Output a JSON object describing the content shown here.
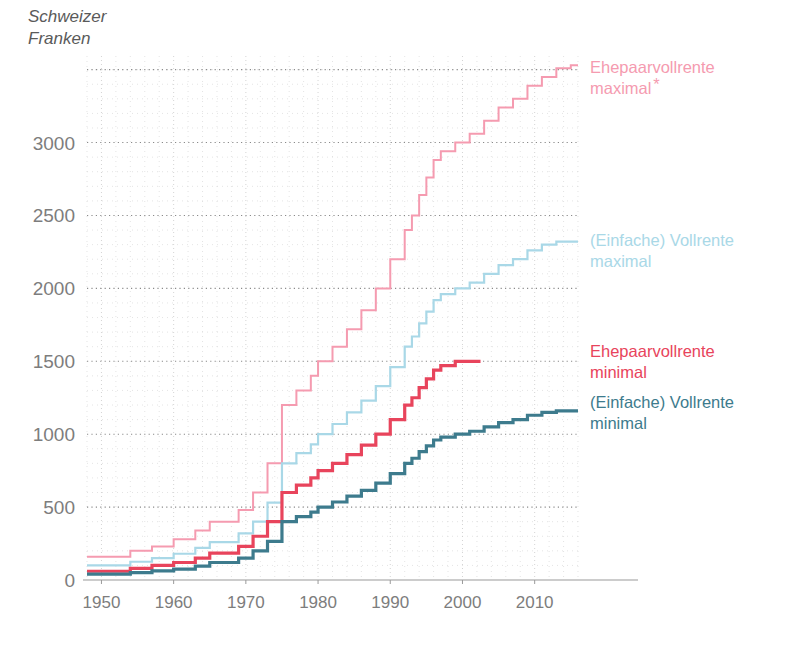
{
  "chart_data": {
    "type": "line",
    "title": "",
    "subtitle": "",
    "ylabel_line1": "Schweizer",
    "ylabel_line2": "Franken",
    "xlabel": "",
    "step_style": "post",
    "grid": true,
    "legend_position": "right-inline",
    "xlim": [
      1948,
      2016
    ],
    "ylim": [
      0,
      3580
    ],
    "yticks": [
      0,
      500,
      1000,
      1500,
      2000,
      2500,
      3000
    ],
    "ytick_labels": [
      "0",
      "500",
      "1000",
      "1500",
      "2000",
      "2500",
      "3000"
    ],
    "xticks": [
      1950,
      1960,
      1970,
      1980,
      1990,
      2000,
      2010
    ],
    "xtick_labels": [
      "1950",
      "1960",
      "1970",
      "1980",
      "1990",
      "2000",
      "2010"
    ],
    "minor_y_interval": 100,
    "minor_x_interval": 2,
    "series": [
      {
        "name": "Ehepaarvollrente maximal",
        "label_line1": "Ehepaarvollrente",
        "label_line2": "maximal",
        "footnote_marker": "*",
        "color": "#f59bb0",
        "width": 2,
        "label_x": 2016,
        "label_y": 3480,
        "x": [
          1948,
          1951,
          1954,
          1957,
          1960,
          1963,
          1965,
          1969,
          1971,
          1973,
          1975,
          1977,
          1979,
          1980,
          1982,
          1984,
          1986,
          1988,
          1990,
          1992,
          1993,
          1994,
          1995,
          1996,
          1997,
          1999,
          2001,
          2003,
          2005,
          2007,
          2009,
          2011,
          2013,
          2015
        ],
        "y": [
          160,
          160,
          200,
          230,
          280,
          340,
          400,
          480,
          600,
          800,
          1200,
          1300,
          1400,
          1500,
          1600,
          1720,
          1850,
          2000,
          2200,
          2400,
          2500,
          2640,
          2760,
          2880,
          2940,
          3000,
          3060,
          3150,
          3240,
          3300,
          3390,
          3450,
          3510,
          3530
        ]
      },
      {
        "name": "(Einfache) Vollrente maximal",
        "label_line1": "(Einfache) Vollrente",
        "label_line2": "maximal",
        "footnote_marker": "",
        "color": "#a9d8e7",
        "width": 2.2,
        "label_x": 2016,
        "label_y": 2290,
        "x": [
          1948,
          1951,
          1954,
          1957,
          1960,
          1963,
          1965,
          1969,
          1971,
          1973,
          1975,
          1977,
          1979,
          1980,
          1982,
          1984,
          1986,
          1988,
          1990,
          1992,
          1993,
          1994,
          1995,
          1996,
          1997,
          1999,
          2001,
          2003,
          2005,
          2007,
          2009,
          2011,
          2013,
          2015
        ],
        "y": [
          100,
          100,
          125,
          150,
          180,
          220,
          260,
          320,
          400,
          530,
          800,
          870,
          930,
          1000,
          1070,
          1150,
          1230,
          1330,
          1460,
          1600,
          1670,
          1760,
          1840,
          1920,
          1960,
          2000,
          2040,
          2100,
          2160,
          2200,
          2260,
          2300,
          2320,
          2320
        ]
      },
      {
        "name": "Ehepaarvollrente minimal",
        "label_line1": "Ehepaarvollrente",
        "label_line2": "minimal",
        "footnote_marker": "",
        "color": "#e8445c",
        "width": 3.2,
        "label_x": 2016,
        "label_y": 1530,
        "x": [
          1948,
          1951,
          1954,
          1957,
          1960,
          1963,
          1965,
          1969,
          1971,
          1973,
          1975,
          1977,
          1979,
          1980,
          1982,
          1984,
          1986,
          1988,
          1990,
          1992,
          1993,
          1994,
          1995,
          1996,
          1997,
          1999,
          2001
        ],
        "y": [
          60,
          60,
          80,
          100,
          120,
          150,
          185,
          230,
          300,
          400,
          600,
          650,
          700,
          750,
          800,
          860,
          925,
          1000,
          1100,
          1200,
          1250,
          1320,
          1380,
          1440,
          1470,
          1500,
          1500
        ]
      },
      {
        "name": "(Einfache) Vollrente minimal",
        "label_line1": "(Einfache) Vollrente",
        "label_line2": "minimal",
        "footnote_marker": "",
        "color": "#3d7b8d",
        "width": 3.2,
        "label_x": 2016,
        "label_y": 1180,
        "x": [
          1948,
          1951,
          1954,
          1957,
          1960,
          1963,
          1965,
          1969,
          1971,
          1973,
          1975,
          1977,
          1979,
          1980,
          1982,
          1984,
          1986,
          1988,
          1990,
          1992,
          1993,
          1994,
          1995,
          1996,
          1997,
          1999,
          2001,
          2003,
          2005,
          2007,
          2009,
          2011,
          2013,
          2015
        ],
        "y": [
          40,
          40,
          50,
          62,
          75,
          95,
          120,
          150,
          200,
          265,
          400,
          435,
          465,
          500,
          535,
          575,
          615,
          665,
          730,
          800,
          835,
          880,
          920,
          960,
          980,
          1000,
          1020,
          1050,
          1080,
          1100,
          1130,
          1150,
          1160,
          1160
        ]
      }
    ]
  },
  "colors": {
    "grid_major": "#8a8a8a",
    "grid_minor": "#d8d8d8",
    "axis_line": "#9a9a9a",
    "tick_text": "#7d7d7d",
    "background": "#ffffff"
  }
}
